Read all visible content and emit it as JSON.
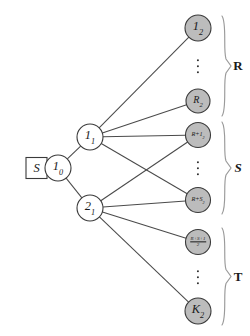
{
  "figure": {
    "type": "layered-tree-diagram",
    "background_color": "#ffffff",
    "edge_color": "#4a4a4a",
    "filled_node_color": "#bcbcbc",
    "open_node_color": "#ffffff",
    "outline_color": "#3a3a3a",
    "brace_color": "#9a9a9a"
  },
  "source": {
    "name": "source-box",
    "label": "S",
    "shape": "square",
    "x": 26,
    "y": 168,
    "size": 21
  },
  "nodes": [
    {
      "id": "root",
      "name": "node-1-0",
      "base": "1",
      "sub": "0",
      "x": 58,
      "y": 168,
      "r": 13,
      "fill": "open",
      "size_class": "lbl-lg"
    },
    {
      "id": "mid1",
      "name": "node-1-1",
      "base": "1",
      "sub": "1",
      "x": 90,
      "y": 137,
      "r": 13,
      "fill": "open",
      "size_class": "lbl-lg"
    },
    {
      "id": "mid2",
      "name": "node-2-1",
      "base": "2",
      "sub": "1",
      "x": 90,
      "y": 208,
      "r": 13,
      "fill": "open",
      "size_class": "lbl-lg"
    },
    {
      "id": "leaf_1_2",
      "name": "node-1-2",
      "base": "1",
      "sub": "2",
      "x": 198,
      "y": 28,
      "r": 13,
      "fill": "filled",
      "size_class": "lbl-lg",
      "group": "R"
    },
    {
      "id": "leaf_R_2",
      "name": "node-R-2",
      "base": "R",
      "sub": "2",
      "x": 198,
      "y": 101,
      "r": 12,
      "fill": "filled",
      "size_class": "lbl-md",
      "group": "R"
    },
    {
      "id": "leaf_Rp1_2",
      "name": "node-R-plus-1-2",
      "base": "R+1",
      "sub": "2",
      "x": 198,
      "y": 135,
      "r": 12.5,
      "fill": "filled",
      "size_class": "lbl-sm",
      "group": "S"
    },
    {
      "id": "leaf_RpS_2",
      "name": "node-R-plus-S-2",
      "base": "R+S",
      "sub": "2",
      "x": 198,
      "y": 200,
      "r": 12.5,
      "fill": "filled",
      "size_class": "lbl-sm",
      "group": "S"
    },
    {
      "id": "leaf_frac",
      "name": "node-fraction-R-plus-S-plus-1-over-2",
      "numerator": "R+S+1",
      "denominator": "2",
      "x": 198,
      "y": 242,
      "r": 12.5,
      "fill": "filled",
      "is_fraction": true,
      "group": "T"
    },
    {
      "id": "leaf_K_2",
      "name": "node-K-2",
      "base": "K",
      "sub": "2",
      "x": 198,
      "y": 311,
      "r": 13,
      "fill": "filled",
      "size_class": "lbl-lg",
      "group": "T"
    }
  ],
  "edges": [
    {
      "name": "edge-source-to-root",
      "from": "source",
      "to": "root"
    },
    {
      "name": "edge-root-to-1-1",
      "from": "root",
      "to": "mid1"
    },
    {
      "name": "edge-root-to-2-1",
      "from": "root",
      "to": "mid2"
    },
    {
      "name": "edge-1-1-to-1-2",
      "from": "mid1",
      "to": "leaf_1_2"
    },
    {
      "name": "edge-1-1-to-R-2",
      "from": "mid1",
      "to": "leaf_R_2"
    },
    {
      "name": "edge-1-1-to-R-plus-1-2",
      "from": "mid1",
      "to": "leaf_Rp1_2"
    },
    {
      "name": "edge-1-1-to-R-plus-S-2",
      "from": "mid1",
      "to": "leaf_RpS_2"
    },
    {
      "name": "edge-2-1-to-R-plus-1-2",
      "from": "mid2",
      "to": "leaf_Rp1_2"
    },
    {
      "name": "edge-2-1-to-R-plus-S-2",
      "from": "mid2",
      "to": "leaf_RpS_2"
    },
    {
      "name": "edge-2-1-to-fraction",
      "from": "mid2",
      "to": "leaf_frac"
    },
    {
      "name": "edge-2-1-to-K-2",
      "from": "mid2",
      "to": "leaf_K_2"
    }
  ],
  "ellipses": [
    {
      "name": "ellipsis-group-R",
      "x": 198,
      "y": 66
    },
    {
      "name": "ellipsis-group-S",
      "x": 198,
      "y": 168
    },
    {
      "name": "ellipsis-group-T",
      "x": 198,
      "y": 277
    }
  ],
  "groups": [
    {
      "name": "group-brace-R",
      "label": "R",
      "italic": false,
      "top": 16,
      "bottom": 116,
      "label_x": 238,
      "label_y": 66
    },
    {
      "name": "group-brace-S",
      "label": "S",
      "italic": true,
      "top": 122,
      "bottom": 214,
      "label_x": 238,
      "label_y": 168
    },
    {
      "name": "group-brace-T",
      "label": "T",
      "italic": false,
      "top": 228,
      "bottom": 325,
      "label_x": 238,
      "label_y": 277
    }
  ]
}
